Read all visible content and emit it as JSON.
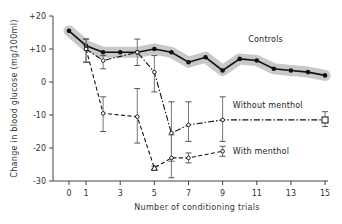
{
  "chart_data": {
    "type": "line",
    "title": "",
    "xlabel": "Number of conditioning trials",
    "ylabel": "Change in blood glucose (mg/100ml)",
    "xlim": [
      0,
      15
    ],
    "ylim": [
      -30,
      20
    ],
    "x_ticks": [
      0,
      1,
      3,
      5,
      7,
      9,
      11,
      13,
      15
    ],
    "x_tick_labels": [
      "0",
      "1",
      "3",
      "5",
      "7",
      "9",
      "11",
      "13",
      "15"
    ],
    "y_ticks": [
      20,
      10,
      0,
      -10,
      -20,
      -30
    ],
    "y_tick_labels": [
      "+20",
      "+10",
      "0",
      "-10",
      "-20",
      "-30"
    ],
    "grid": false,
    "series": [
      {
        "name": "Controls",
        "style": "solid",
        "marker": "filled-circle",
        "band": true,
        "x": [
          0,
          1,
          2,
          3,
          4,
          5,
          6,
          7,
          8,
          9,
          10,
          11,
          12,
          13,
          14,
          15
        ],
        "y": [
          15.5,
          11,
          9,
          9,
          9,
          10,
          9,
          6,
          7.5,
          3.5,
          7,
          6.5,
          4,
          3.5,
          3,
          2
        ]
      },
      {
        "name": "Without menthol",
        "style": "dash-dot",
        "marker": "open-circle",
        "x": [
          1,
          2,
          4,
          5,
          6,
          7,
          9,
          15
        ],
        "y": [
          10,
          6.5,
          9,
          3,
          -15.5,
          -13,
          -11.5,
          -11.5
        ],
        "err_low": [
          6,
          4,
          5,
          -3,
          -24,
          -18,
          -18,
          -13.5
        ],
        "err_high": [
          13,
          8,
          13,
          8,
          -6,
          -6,
          -4.5,
          -9
        ],
        "last_marker": "open-square"
      },
      {
        "name": "With menthol",
        "style": "dashed",
        "marker": "open-circle",
        "x": [
          1,
          2,
          4,
          5,
          6,
          7,
          9
        ],
        "y": [
          10,
          -9.5,
          -10.5,
          -26,
          -23,
          -23,
          -21
        ],
        "err_low": [
          6,
          -15,
          -18.5,
          -26.5,
          -29,
          -24.5,
          -22.5
        ],
        "err_high": [
          13,
          -4.5,
          -2,
          -25.5,
          -16,
          -21.5,
          -19.5
        ],
        "special_marker": {
          "x": 5,
          "shape": "open-triangle"
        }
      }
    ],
    "annotations": [
      {
        "text": "Controls",
        "near_series": "Controls",
        "x": 10.5,
        "y": 13
      },
      {
        "text": "Without menthol",
        "near_series": "Without menthol",
        "x": 9.6,
        "y": -7
      },
      {
        "text": "With menthol",
        "near_series": "With menthol",
        "x": 9.6,
        "y": -21
      }
    ]
  }
}
